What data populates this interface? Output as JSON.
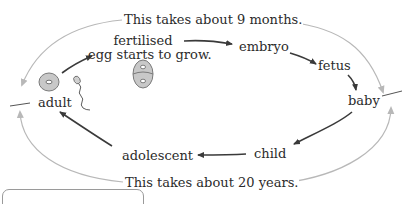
{
  "diagram": {
    "type": "life-cycle",
    "stages": [
      {
        "id": "adult",
        "label": "adult"
      },
      {
        "id": "fertilised_egg",
        "label_line1": "fertilised",
        "label_line2": "egg starts to grow."
      },
      {
        "id": "embryo",
        "label": "embryo"
      },
      {
        "id": "fetus",
        "label": "fetus"
      },
      {
        "id": "baby",
        "label": "baby"
      },
      {
        "id": "child",
        "label": "child"
      },
      {
        "id": "adolescent",
        "label": "adolescent"
      }
    ],
    "arrows": [
      {
        "from": "adult",
        "to": "fertilised_egg"
      },
      {
        "from": "fertilised_egg",
        "to": "embryo"
      },
      {
        "from": "embryo",
        "to": "fetus"
      },
      {
        "from": "fetus",
        "to": "baby"
      },
      {
        "from": "baby",
        "to": "child"
      },
      {
        "from": "child",
        "to": "adolescent"
      },
      {
        "from": "adolescent",
        "to": "adult"
      }
    ],
    "durations": {
      "top": "This takes about 9 months.",
      "bottom": "This takes about 20 years."
    },
    "icons": {
      "egg": "egg-cell-icon",
      "sperm": "sperm-cell-icon",
      "dividing_cell": "dividing-cell-icon"
    },
    "colors": {
      "text": "#2b2b2b",
      "stage_arrow": "#3a3a3a",
      "duration_arc": "#b8b8b8",
      "cell_fill": "#c8c8c8",
      "cell_stroke": "#7a7a7a"
    }
  }
}
